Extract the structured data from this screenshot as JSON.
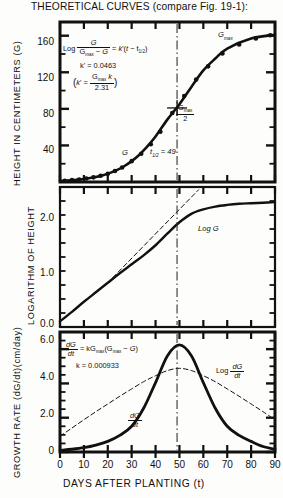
{
  "title": "THEORETICAL CURVES (compare Fig. 19-1):",
  "axis_titles": {
    "top_y": "HEIGHT IN CENTIMETERS (G)",
    "mid_y": "LOGARITHM OF HEIGHT",
    "bot_y": "GROWTH RATE (dG/dt)(cm/day)",
    "x": "DAYS AFTER PLANTING (t)"
  },
  "x_ticks": [
    "0",
    "10",
    "20",
    "30",
    "40",
    "50",
    "60",
    "70",
    "80",
    "90"
  ],
  "panels": {
    "top": {
      "y_ticks": [
        "40",
        "80",
        "120",
        "160"
      ],
      "annotations": {
        "gmax": "Gmax",
        "gmax_over_2_num": "Gmax",
        "gmax_over_2_den": "2",
        "curve_label": "G",
        "thalf": "t1/2 = 49",
        "eq_log": "Log",
        "eq_num": "G",
        "eq_den": "Gmax − G",
        "eq_rhs": "= k'(t − t1/2)",
        "kprime": "k' = 0.0463",
        "kprime_def_lhs": "k' =",
        "kprime_def_num": "Gmax k",
        "kprime_def_den": "2.31"
      }
    },
    "middle": {
      "y_ticks": [
        "0.0",
        "1.0",
        "2.0"
      ],
      "annotations": {
        "curve_label": "Log G"
      }
    },
    "bottom": {
      "y_ticks": [
        "0",
        "2.0",
        "4.0",
        "6.0"
      ],
      "annotations": {
        "eq_num": "dG",
        "eq_den": "dt",
        "eq_rhs": "= kGmax(Gmax − G)",
        "k_value": "k = 0.000933",
        "curve_label_num": "dG",
        "curve_label_den": "dt",
        "dashed_label": "Log",
        "dashed_num": "dG",
        "dashed_den": "dt"
      }
    }
  },
  "colors": {
    "ink": "#111111",
    "paper": "#fdfdfb"
  },
  "chart_data": [
    {
      "type": "line",
      "title": "Height vs days after planting (logistic G)",
      "xlabel": "DAYS AFTER PLANTING (t)",
      "ylabel": "HEIGHT IN CENTIMETERS (G)",
      "xlim": [
        0,
        90
      ],
      "ylim": [
        0,
        175
      ],
      "xticks": [
        0,
        10,
        20,
        30,
        40,
        50,
        60,
        70,
        80,
        90
      ],
      "yticks": [
        40,
        80,
        120,
        160
      ],
      "grid": false,
      "parameters": {
        "Gmax": 162,
        "t_half": 49,
        "k_prime": 0.0463,
        "k": 0.000933
      },
      "series": [
        {
          "name": "G",
          "style": "solid-with-points",
          "x": [
            0,
            3,
            6,
            9,
            12,
            15,
            18,
            21,
            24,
            27,
            30,
            33,
            36,
            40,
            45,
            50,
            55,
            60,
            65,
            70,
            80,
            90
          ],
          "y": [
            1.2,
            1.6,
            2.2,
            3.0,
            4.1,
            5.5,
            7.4,
            10.0,
            13.3,
            17.5,
            22.8,
            29.3,
            37.2,
            49.8,
            68.5,
            85.0,
            104.0,
            122.0,
            135.0,
            146.0,
            157.0,
            161.0
          ]
        }
      ],
      "markers": {
        "x": [
          2,
          5,
          8,
          11,
          14,
          17,
          20,
          23,
          26,
          30,
          34,
          38,
          42,
          47,
          52,
          57,
          62,
          68,
          75,
          82,
          88
        ],
        "y": [
          1.4,
          2.0,
          2.8,
          3.8,
          5.1,
          6.8,
          9.1,
          12.1,
          15.9,
          22.8,
          30.9,
          41.3,
          55.0,
          75.5,
          94.0,
          112.0,
          126.5,
          140.5,
          150.5,
          157.0,
          160.5
        ]
      },
      "annotations": [
        {
          "text": "Gmax",
          "x": 72,
          "y": 166
        },
        {
          "text": "Gmax/2",
          "x": 54,
          "y": 82
        },
        {
          "text": "G",
          "x": 36,
          "y": 41
        },
        {
          "text": "t1/2 = 49",
          "x": 50,
          "y": 35
        },
        {
          "text": "vline",
          "x": 49
        }
      ]
    },
    {
      "type": "line",
      "title": "Logarithm of height",
      "xlabel": "DAYS AFTER PLANTING (t)",
      "ylabel": "LOGARITHM OF HEIGHT",
      "xlim": [
        0,
        90
      ],
      "ylim": [
        -0.15,
        2.35
      ],
      "xticks": [
        0,
        10,
        20,
        30,
        40,
        50,
        60,
        70,
        80,
        90
      ],
      "yticks": [
        0.0,
        1.0,
        2.0
      ],
      "grid": false,
      "series": [
        {
          "name": "Log G",
          "style": "solid",
          "x": [
            0,
            5,
            10,
            15,
            20,
            25,
            30,
            35,
            40,
            45,
            50,
            55,
            60,
            65,
            70,
            75,
            80,
            85,
            90
          ],
          "y": [
            -0.05,
            0.12,
            0.3,
            0.47,
            0.64,
            0.81,
            0.97,
            1.13,
            1.31,
            1.52,
            1.72,
            1.87,
            1.95,
            2.0,
            2.03,
            2.05,
            2.06,
            2.07,
            2.08
          ]
        },
        {
          "name": "asymptote-dashed",
          "style": "dashed",
          "x": [
            20,
            58
          ],
          "y": [
            0.64,
            2.3
          ]
        }
      ],
      "annotations": [
        {
          "text": "Log G",
          "x": 62,
          "y": 1.88
        },
        {
          "text": "vline",
          "x": 49
        }
      ]
    },
    {
      "type": "line",
      "title": "Growth rate dG/dt and its logarithm",
      "xlabel": "DAYS AFTER PLANTING (t)",
      "ylabel": "GROWTH RATE (dG/dt)(cm/day)",
      "xlim": [
        0,
        90
      ],
      "ylim": [
        0,
        7.0
      ],
      "xticks": [
        0,
        10,
        20,
        30,
        40,
        50,
        60,
        70,
        80,
        90
      ],
      "yticks": [
        0,
        2.0,
        4.0,
        6.0
      ],
      "grid": false,
      "series": [
        {
          "name": "dG/dt",
          "style": "solid",
          "x": [
            0,
            5,
            10,
            15,
            20,
            25,
            30,
            35,
            40,
            45,
            50,
            55,
            60,
            65,
            70,
            75,
            80,
            85,
            90
          ],
          "y": [
            0.1,
            0.16,
            0.25,
            0.4,
            0.62,
            0.97,
            1.5,
            2.55,
            4.05,
            5.62,
            6.25,
            5.62,
            4.05,
            2.55,
            1.5,
            0.97,
            0.62,
            0.32,
            0.16
          ]
        },
        {
          "name": "Log dG/dt",
          "style": "dashed",
          "x": [
            0,
            5,
            10,
            15,
            20,
            25,
            30,
            35,
            40,
            45,
            50,
            55,
            60,
            65,
            70,
            75,
            80,
            85,
            90
          ],
          "y": [
            0.92,
            1.4,
            1.88,
            2.35,
            2.8,
            3.25,
            3.68,
            4.1,
            4.45,
            4.75,
            4.88,
            4.75,
            4.45,
            4.1,
            3.68,
            3.25,
            2.8,
            2.35,
            1.88
          ]
        }
      ],
      "annotations": [
        {
          "text": "dG/dt = kGmax(Gmax - G)",
          "x": 10,
          "y": 6.3
        },
        {
          "text": "k = 0.000933",
          "x": 14,
          "y": 5.35
        },
        {
          "text": "dG/dt",
          "x": 36,
          "y": 1.95
        },
        {
          "text": "Log dG/dt",
          "x": 70,
          "y": 4.35
        },
        {
          "text": "vline",
          "x": 49
        }
      ]
    }
  ]
}
